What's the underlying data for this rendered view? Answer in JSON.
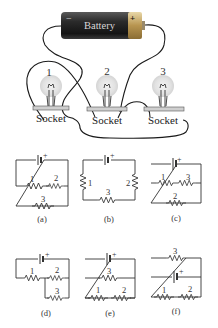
{
  "photo": {
    "battery": {
      "label": "Battery",
      "negative_sign": "−",
      "positive_sign": "+"
    },
    "bulbs": [
      {
        "number": "1",
        "socket_label": "Socket"
      },
      {
        "number": "2",
        "socket_label": "Socket"
      },
      {
        "number": "3",
        "socket_label": "Socket"
      }
    ]
  },
  "schematics": [
    {
      "caption": "(a)",
      "battery_plus": "+",
      "resistor_labels": [
        "1",
        "2",
        "3"
      ]
    },
    {
      "caption": "(b)",
      "battery_plus": "+",
      "resistor_labels": [
        "1",
        "2",
        "3"
      ]
    },
    {
      "caption": "(c)",
      "battery_plus": "+",
      "resistor_labels": [
        "1",
        "3",
        "2"
      ]
    },
    {
      "caption": "(d)",
      "battery_plus": "+",
      "resistor_labels": [
        "1",
        "2",
        "3"
      ]
    },
    {
      "caption": "(e)",
      "battery_plus": "+",
      "resistor_labels": [
        "3",
        "1",
        "2"
      ]
    },
    {
      "caption": "(f)",
      "battery_plus": "+",
      "resistor_labels": [
        "3",
        "1",
        "2"
      ]
    }
  ],
  "colors": {
    "battery_body": "#2a2a2a",
    "battery_cap": "#c8a860",
    "bulb_glow": "#e6e6e6",
    "wire": "#1a1a1a"
  }
}
